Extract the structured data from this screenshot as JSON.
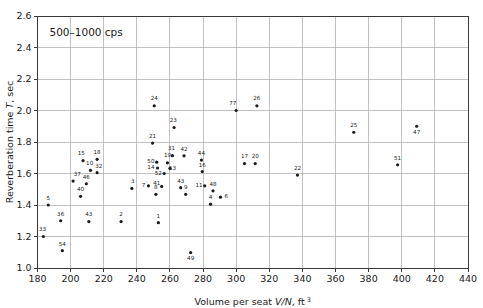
{
  "chart_data": {
    "type": "scatter",
    "title": "",
    "annotation": "500–1000 cps",
    "xlabel": "Volume per seat V/N, ft 3",
    "xlabel_parts": {
      "prefix": "Volume per seat ",
      "italic": "V/N",
      "suffix": ", ft",
      "sup": "3"
    },
    "ylabel": "Reverberation time T, sec",
    "ylabel_parts": {
      "prefix": "Reverberation time ",
      "italic": "T",
      "suffix": ", sec"
    },
    "xlim": [
      180,
      440
    ],
    "ylim": [
      1.0,
      2.6
    ],
    "xticks": [
      180,
      200,
      220,
      240,
      260,
      280,
      300,
      320,
      340,
      360,
      380,
      400,
      420,
      440
    ],
    "yticks": [
      "1.0",
      "1.2",
      "1.4",
      "1.6",
      "1.8",
      "2.0",
      "2.2",
      "2.4",
      "2.6"
    ],
    "ytick_values": [
      1.0,
      1.2,
      1.4,
      1.6,
      1.8,
      2.0,
      2.2,
      2.4,
      2.6
    ],
    "grid": true,
    "legend": "none",
    "marker_color": "#1b1b1b",
    "grid_color": "#a8a8a8",
    "axis_color": "#3a3a3a",
    "points": [
      {
        "label": "5",
        "x": 186.5,
        "y": 1.4,
        "lx": 186.5,
        "ly": 1.447
      },
      {
        "label": "33",
        "x": 183.5,
        "y": 1.2,
        "lx": 183.0,
        "ly": 1.245
      },
      {
        "label": "36",
        "x": 194.0,
        "y": 1.3,
        "lx": 194.0,
        "ly": 1.345
      },
      {
        "label": "54",
        "x": 195.0,
        "y": 1.11,
        "lx": 195.0,
        "ly": 1.155
      },
      {
        "label": "37",
        "x": 201.5,
        "y": 1.552,
        "lx": 204.0,
        "ly": 1.597
      },
      {
        "label": "40",
        "x": 206.0,
        "y": 1.455,
        "lx": 206.0,
        "ly": 1.5
      },
      {
        "label": "15",
        "x": 207.5,
        "y": 1.682,
        "lx": 206.5,
        "ly": 1.727
      },
      {
        "label": "46",
        "x": 209.5,
        "y": 1.535,
        "lx": 209.5,
        "ly": 1.58
      },
      {
        "label": "10",
        "x": 212.0,
        "y": 1.62,
        "lx": 211.5,
        "ly": 1.665
      },
      {
        "label": "43",
        "x": 211.0,
        "y": 1.295,
        "lx": 211.0,
        "ly": 1.34
      },
      {
        "label": "18",
        "x": 216.0,
        "y": 1.69,
        "lx": 216.0,
        "ly": 1.735
      },
      {
        "label": "32",
        "x": 216.0,
        "y": 1.605,
        "lx": 217.0,
        "ly": 1.65
      },
      {
        "label": "2",
        "x": 230.5,
        "y": 1.295,
        "lx": 230.5,
        "ly": 1.34
      },
      {
        "label": "3",
        "x": 237.0,
        "y": 1.505,
        "lx": 237.5,
        "ly": 1.553
      },
      {
        "label": "7",
        "x": 247.0,
        "y": 1.522,
        "lx": 244.0,
        "ly": 1.527
      },
      {
        "label": "21",
        "x": 249.5,
        "y": 1.793,
        "lx": 249.5,
        "ly": 1.838
      },
      {
        "label": "24",
        "x": 250.5,
        "y": 2.03,
        "lx": 250.5,
        "ly": 2.077
      },
      {
        "label": "50",
        "x": 252.0,
        "y": 1.672,
        "lx": 248.5,
        "ly": 1.68
      },
      {
        "label": "14",
        "x": 252.5,
        "y": 1.635,
        "lx": 248.5,
        "ly": 1.642
      },
      {
        "label": "8",
        "x": 251.5,
        "y": 1.468,
        "lx": 251.5,
        "ly": 1.513
      },
      {
        "label": "1",
        "x": 253.0,
        "y": 1.288,
        "lx": 253.0,
        "ly": 1.333
      },
      {
        "label": "52",
        "x": 256.5,
        "y": 1.6,
        "lx": 253.0,
        "ly": 1.603
      },
      {
        "label": "41",
        "x": 255.0,
        "y": 1.518,
        "lx": 252.0,
        "ly": 1.537
      },
      {
        "label": "19",
        "x": 258.5,
        "y": 1.668,
        "lx": 258.5,
        "ly": 1.715
      },
      {
        "label": "13",
        "x": 260.0,
        "y": 1.633,
        "lx": 261.5,
        "ly": 1.638
      },
      {
        "label": "31",
        "x": 261.5,
        "y": 1.713,
        "lx": 261.0,
        "ly": 1.76
      },
      {
        "label": "23",
        "x": 262.5,
        "y": 1.892,
        "lx": 262.0,
        "ly": 1.937
      },
      {
        "label": "42",
        "x": 268.5,
        "y": 1.712,
        "lx": 268.5,
        "ly": 1.757
      },
      {
        "label": "9",
        "x": 269.5,
        "y": 1.468,
        "lx": 269.5,
        "ly": 1.513
      },
      {
        "label": "43b",
        "x": 266.5,
        "y": 1.51,
        "lx": 266.5,
        "ly": 1.555
      },
      {
        "label": "49",
        "x": 272.5,
        "y": 1.098,
        "lx": 272.5,
        "ly": 1.062
      },
      {
        "label": "44",
        "x": 279.0,
        "y": 1.685,
        "lx": 279.0,
        "ly": 1.73
      },
      {
        "label": "16",
        "x": 279.5,
        "y": 1.612,
        "lx": 279.5,
        "ly": 1.657
      },
      {
        "label": "11",
        "x": 281.0,
        "y": 1.522,
        "lx": 277.5,
        "ly": 1.527
      },
      {
        "label": "48",
        "x": 286.0,
        "y": 1.49,
        "lx": 286.0,
        "ly": 1.533
      },
      {
        "label": "4",
        "x": 284.5,
        "y": 1.405,
        "lx": 284.5,
        "ly": 1.45
      },
      {
        "label": "6",
        "x": 290.5,
        "y": 1.45,
        "lx": 294.0,
        "ly": 1.455
      },
      {
        "label": "77",
        "x": 300.0,
        "y": 2.0,
        "lx": 298.0,
        "ly": 2.045
      },
      {
        "label": "26",
        "x": 312.5,
        "y": 2.03,
        "lx": 312.5,
        "ly": 2.077
      },
      {
        "label": "17",
        "x": 305.0,
        "y": 1.663,
        "lx": 305.0,
        "ly": 1.708
      },
      {
        "label": "20",
        "x": 311.5,
        "y": 1.663,
        "lx": 311.5,
        "ly": 1.708
      },
      {
        "label": "22",
        "x": 337.0,
        "y": 1.59,
        "lx": 337.0,
        "ly": 1.635
      },
      {
        "label": "25",
        "x": 371.0,
        "y": 1.862,
        "lx": 371.0,
        "ly": 1.907
      },
      {
        "label": "51",
        "x": 397.5,
        "y": 1.655,
        "lx": 397.5,
        "ly": 1.7
      },
      {
        "label": "47",
        "x": 409.0,
        "y": 1.9,
        "lx": 409.0,
        "ly": 1.862
      }
    ]
  }
}
